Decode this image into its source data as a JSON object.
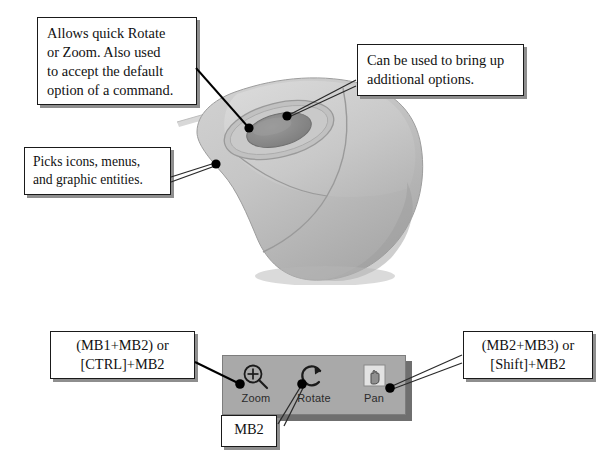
{
  "diagram": {
    "background_color": "#ffffff",
    "ink_color": "#000000"
  },
  "callouts": {
    "wheel": {
      "name": "wheel-callout",
      "line1": "Allows quick Rotate",
      "line2": "or Zoom. Also used",
      "line3": "to accept the default",
      "line4": "option of a command."
    },
    "mb3": {
      "name": "right-button-callout",
      "line1": "Can be used to bring up",
      "line2": "additional options."
    },
    "mb1": {
      "name": "left-button-callout",
      "line1": "Picks icons, menus,",
      "line2": "and graphic entities."
    },
    "zoom_keys": {
      "name": "zoom-shortcut-callout",
      "line1": "(MB1+MB2) or",
      "line2": "[CTRL]+MB2"
    },
    "pan_keys": {
      "name": "pan-shortcut-callout",
      "line1": "(MB2+MB3) or",
      "line2": "[Shift]+MB2"
    },
    "rotate_key": {
      "name": "rotate-shortcut-callout",
      "line1": "MB2"
    }
  },
  "toolbar": {
    "name": "view-toolbar",
    "background_color": "#a9a9a9",
    "shadow_color": "#6f6f6f",
    "buttons": [
      {
        "icon": "zoom-magnifier-plus-icon",
        "label": "Zoom"
      },
      {
        "icon": "rotate-arrow-icon",
        "label": "Rotate"
      },
      {
        "icon": "pan-hand-icon",
        "label": "Pan"
      }
    ]
  },
  "mouse": {
    "name": "three-button-mouse",
    "body_color": "#c6c6c6",
    "body_shade": "#b0b0b0",
    "wheel_color": "#8d8d8d",
    "wheel_ring_color": "#bdbdbd",
    "cable_color": "#d6d6d6",
    "parts": [
      {
        "name": "scroll-wheel-mb2",
        "label": "wheel / MB2"
      },
      {
        "name": "left-button-mb1",
        "label": "MB1"
      },
      {
        "name": "right-button-mb3",
        "label": "MB3"
      }
    ]
  }
}
